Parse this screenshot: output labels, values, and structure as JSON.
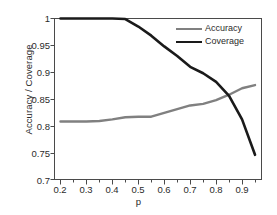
{
  "chart_data": {
    "type": "line",
    "title": "",
    "xlabel": "p",
    "ylabel": "Accuracy / Coverage",
    "xlim": [
      0.175,
      0.975
    ],
    "ylim": [
      0.7,
      1.0
    ],
    "grid": false,
    "legend_position": "upper-right",
    "xticks": [
      "0.2",
      "0.3",
      "0.4",
      "0.5",
      "0.6",
      "0.7",
      "0.8",
      "0.9"
    ],
    "xtick_values": [
      0.2,
      0.3,
      0.4,
      0.5,
      0.6,
      0.7,
      0.8,
      0.9
    ],
    "xminor_tick_step": 0.05,
    "yticks": [
      "0.7",
      "0.75",
      "0.8",
      "0.85",
      "0.9",
      "0.95",
      "1"
    ],
    "ytick_values": [
      0.7,
      0.75,
      0.8,
      0.85,
      0.9,
      0.95,
      1.0
    ],
    "x": [
      0.2,
      0.25,
      0.3,
      0.35,
      0.4,
      0.45,
      0.5,
      0.55,
      0.6,
      0.65,
      0.7,
      0.75,
      0.8,
      0.85,
      0.9,
      0.95
    ],
    "series": [
      {
        "name": "Accuracy",
        "color": "#808080",
        "values": [
          0.808,
          0.808,
          0.808,
          0.809,
          0.812,
          0.816,
          0.817,
          0.817,
          0.824,
          0.831,
          0.838,
          0.841,
          0.848,
          0.858,
          0.87,
          0.876
        ]
      },
      {
        "name": "Coverage",
        "color": "#1a1a1a",
        "values": [
          1.0,
          1.0,
          1.0,
          1.0,
          1.0,
          0.999,
          0.985,
          0.968,
          0.948,
          0.93,
          0.91,
          0.898,
          0.882,
          0.856,
          0.812,
          0.746
        ]
      }
    ]
  },
  "legend": {
    "items": [
      {
        "label": "Accuracy"
      },
      {
        "label": "Coverage"
      }
    ]
  },
  "axes": {
    "frame_color": "#4a4a4a"
  }
}
